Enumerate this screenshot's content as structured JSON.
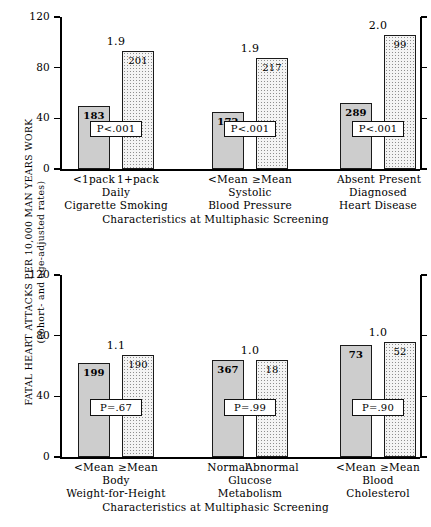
{
  "axis": {
    "y_label_line1": "FATAL HEART ATTACKS PER 10,000 MAN YEARS WORK",
    "y_label_line2": "(cohort- and age-adjusted rates)",
    "x_axis_title": "Characteristics at Multiphasic Screening",
    "y_ticks": [
      "0",
      "40",
      "80",
      "120"
    ]
  },
  "chart_data": {
    "type": "bar",
    "title": "",
    "xlabel": "Characteristics at Multiphasic Screening",
    "ylabel": "FATAL HEART ATTACKS PER 10,000 MAN YEARS WORK (cohort- and age-adjusted rates)",
    "ylim": [
      0,
      120
    ],
    "yticks": [
      0,
      40,
      80,
      120
    ],
    "grid": false,
    "legend": "none",
    "panels": [
      {
        "panel_id": "top",
        "x_axis_title": "Characteristics at Multiphasic Screening",
        "groups": [
          {
            "group_label_line1": "Daily",
            "group_label_line2": "Cigarette Smoking",
            "ratio": "1.9",
            "p_value": "P<.001",
            "bars": [
              {
                "category": "<1pack",
                "value": 50,
                "count": "183",
                "fill": "solid"
              },
              {
                "category": "1+pack",
                "value": 93,
                "count": "201",
                "fill": "dots"
              }
            ]
          },
          {
            "group_label_line1": "Systolic",
            "group_label_line2": "Blood Pressure",
            "ratio": "1.9",
            "p_value": "P<.001",
            "bars": [
              {
                "category": "<Mean",
                "value": 45,
                "count": "172",
                "fill": "solid"
              },
              {
                "category": "≥Mean",
                "value": 88,
                "count": "217",
                "fill": "dots"
              }
            ]
          },
          {
            "group_label_line1": "Diagnosed",
            "group_label_line2": "Heart Disease",
            "ratio": "2.0",
            "p_value": "P<.001",
            "bars": [
              {
                "category": "Absent",
                "value": 52,
                "count": "289",
                "fill": "solid"
              },
              {
                "category": "Present",
                "value": 106,
                "count": "99",
                "fill": "dots"
              }
            ]
          }
        ]
      },
      {
        "panel_id": "bottom",
        "x_axis_title": "Characteristics at Multiphasic Screening",
        "groups": [
          {
            "group_label_line1": "Body",
            "group_label_line2": "Weight-for-Height",
            "ratio": "1.1",
            "p_value": "P=.67",
            "bars": [
              {
                "category": "<Mean",
                "value": 62,
                "count": "199",
                "fill": "solid"
              },
              {
                "category": "≥Mean",
                "value": 67,
                "count": "190",
                "fill": "dots"
              }
            ]
          },
          {
            "group_label_line1": "Glucose",
            "group_label_line2": "Metabolism",
            "ratio": "1.0",
            "p_value": "P=.99",
            "bars": [
              {
                "category": "Normal",
                "value": 64,
                "count": "367",
                "fill": "solid"
              },
              {
                "category": "Abnormal",
                "value": 64,
                "count": "18",
                "fill": "dots"
              }
            ]
          },
          {
            "group_label_line1": "Blood",
            "group_label_line2": "Cholesterol",
            "ratio": "1.0",
            "p_value": "P=.90",
            "bars": [
              {
                "category": "<Mean",
                "value": 74,
                "count": "73",
                "fill": "solid"
              },
              {
                "category": "≥Mean",
                "value": 76,
                "count": "52",
                "fill": "dots"
              }
            ]
          }
        ]
      }
    ]
  }
}
